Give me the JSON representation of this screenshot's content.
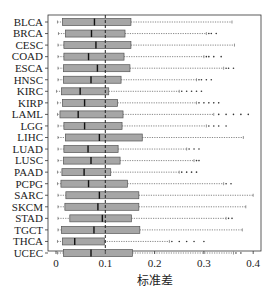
{
  "chart_data": {
    "type": "boxplot",
    "orientation": "horizontal",
    "title": "",
    "xlabel": "标准差",
    "ylabel": "",
    "xlim": [
      -0.02,
      0.42
    ],
    "xticks": [
      0,
      0.1,
      0.2,
      0.3,
      0.4
    ],
    "xtick_labels": [
      "0",
      "0.1",
      "0.2",
      "0.3",
      "0.4"
    ],
    "reference_line": {
      "x": 0.1,
      "style": "dashed",
      "color": "#222222"
    },
    "grid": false,
    "legend": null,
    "colors": {
      "box_fill": "#a6a6a6",
      "box_edge": "#555555",
      "median": "#111111",
      "whisker": "#555555",
      "outlier": "#333333",
      "axis": "#333333"
    },
    "categories": [
      "BLCA",
      "BRCA",
      "CESC",
      "COAD",
      "ESCA",
      "HNSC",
      "KIRC",
      "KIRP",
      "LAML",
      "LGG",
      "LIHC",
      "LUAD",
      "LUSC",
      "PAAD",
      "PCPG",
      "SARC",
      "SKCM",
      "STAD",
      "TGCT",
      "THCA",
      "UCEC"
    ],
    "boxes": [
      {
        "label": "BLCA",
        "whislo": 0.003,
        "q1": 0.013,
        "med": 0.078,
        "q3": 0.152,
        "whishi": 0.357,
        "fliers": []
      },
      {
        "label": "BRCA",
        "whislo": 0.005,
        "q1": 0.019,
        "med": 0.072,
        "q3": 0.14,
        "whishi": 0.305,
        "fliers": [
          0.31,
          0.315,
          0.325
        ]
      },
      {
        "label": "CESC",
        "whislo": 0.004,
        "q1": 0.016,
        "med": 0.081,
        "q3": 0.152,
        "whishi": 0.362,
        "fliers": []
      },
      {
        "label": "COAD",
        "whislo": 0.004,
        "q1": 0.016,
        "med": 0.066,
        "q3": 0.138,
        "whishi": 0.3,
        "fliers": [
          0.305,
          0.31,
          0.32,
          0.335
        ]
      },
      {
        "label": "ESCA",
        "whislo": 0.004,
        "q1": 0.015,
        "med": 0.084,
        "q3": 0.15,
        "whishi": 0.34,
        "fliers": [
          0.345,
          0.35,
          0.36
        ]
      },
      {
        "label": "HNSC",
        "whislo": 0.004,
        "q1": 0.015,
        "med": 0.071,
        "q3": 0.132,
        "whishi": 0.285,
        "fliers": [
          0.29,
          0.295,
          0.305,
          0.315
        ]
      },
      {
        "label": "KIRC",
        "whislo": 0.001,
        "q1": 0.011,
        "med": 0.049,
        "q3": 0.107,
        "whishi": 0.25,
        "fliers": [
          0.255,
          0.265,
          0.275,
          0.285,
          0.295
        ]
      },
      {
        "label": "KIRP",
        "whislo": 0.003,
        "q1": 0.013,
        "med": 0.058,
        "q3": 0.125,
        "whishi": 0.285,
        "fliers": [
          0.29,
          0.3,
          0.31,
          0.32,
          0.33
        ]
      },
      {
        "label": "LAML",
        "whislo": 0.003,
        "q1": 0.008,
        "med": 0.045,
        "q3": 0.136,
        "whishi": 0.32,
        "fliers": [
          0.33,
          0.345,
          0.36,
          0.375,
          0.39
        ]
      },
      {
        "label": "LGG",
        "whislo": 0.004,
        "q1": 0.016,
        "med": 0.058,
        "q3": 0.134,
        "whishi": 0.305,
        "fliers": [
          0.31,
          0.32,
          0.33,
          0.345
        ]
      },
      {
        "label": "LIHC",
        "whislo": 0.004,
        "q1": 0.019,
        "med": 0.088,
        "q3": 0.175,
        "whishi": 0.38,
        "fliers": []
      },
      {
        "label": "LUAD",
        "whislo": 0.004,
        "q1": 0.016,
        "med": 0.065,
        "q3": 0.126,
        "whishi": 0.265,
        "fliers": [
          0.27,
          0.28,
          0.29
        ]
      },
      {
        "label": "LUSC",
        "whislo": 0.004,
        "q1": 0.015,
        "med": 0.071,
        "q3": 0.13,
        "whishi": 0.28,
        "fliers": [
          0.285,
          0.29
        ]
      },
      {
        "label": "PAAD",
        "whislo": 0.003,
        "q1": 0.012,
        "med": 0.057,
        "q3": 0.111,
        "whishi": 0.25,
        "fliers": [
          0.255,
          0.265,
          0.275,
          0.285
        ]
      },
      {
        "label": "PCPG",
        "whislo": 0.003,
        "q1": 0.01,
        "med": 0.066,
        "q3": 0.145,
        "whishi": 0.34,
        "fliers": [
          0.345,
          0.355
        ]
      },
      {
        "label": "SARC",
        "whislo": 0.004,
        "q1": 0.02,
        "med": 0.088,
        "q3": 0.168,
        "whishi": 0.4,
        "fliers": []
      },
      {
        "label": "SKCM",
        "whislo": 0.004,
        "q1": 0.018,
        "med": 0.085,
        "q3": 0.168,
        "whishi": 0.385,
        "fliers": []
      },
      {
        "label": "STAD",
        "whislo": 0.004,
        "q1": 0.028,
        "med": 0.094,
        "q3": 0.153,
        "whishi": 0.345,
        "fliers": [
          0.35,
          0.357
        ]
      },
      {
        "label": "TGCT",
        "whislo": 0.004,
        "q1": 0.011,
        "med": 0.077,
        "q3": 0.17,
        "whishi": 0.378,
        "fliers": []
      },
      {
        "label": "THCA",
        "whislo": 0.003,
        "q1": 0.013,
        "med": 0.038,
        "q3": 0.098,
        "whishi": 0.23,
        "fliers": [
          0.235,
          0.25,
          0.265,
          0.28,
          0.3
        ]
      },
      {
        "label": "UCEC",
        "whislo": 0.003,
        "q1": 0.015,
        "med": 0.071,
        "q3": 0.155,
        "whishi": 0.36,
        "fliers": [
          0.365,
          0.375
        ]
      }
    ]
  },
  "layout": {
    "plot": {
      "left": 48,
      "top": 15,
      "right": 261,
      "bottom": 251
    },
    "x0_px": 56,
    "px_per_unit": 493,
    "row_first_y": 22,
    "row_step": 11.55,
    "box_height": 7
  }
}
